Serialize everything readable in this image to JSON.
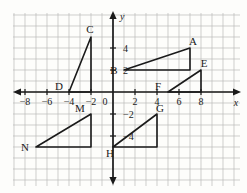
{
  "figure": {
    "type": "coordinate-plane",
    "background_color": "#fdfdfb",
    "grid_color": "#b9b9b9",
    "axis_color": "#1a1a1a",
    "shape_color": "#1a1a1a"
  },
  "axes": {
    "x_label": "x",
    "y_label": "y",
    "origin_label": "0",
    "x_ticks": [
      "-8",
      "-6",
      "-4",
      "-2",
      "2",
      "4",
      "6",
      "8"
    ],
    "y_ticks": [
      "4",
      "2",
      "-2",
      "-4"
    ],
    "x_range": [
      -9.5,
      9
    ],
    "y_range": [
      -7,
      6.5
    ],
    "grid": true,
    "grid_step": 1
  },
  "chart_data": {
    "type": "scatter",
    "title": "",
    "xlabel": "x",
    "ylabel": "y",
    "xlim": [
      -9.5,
      9
    ],
    "ylim": [
      -7,
      6.5
    ],
    "grid": true,
    "shapes": [
      {
        "name": "triangle-CD",
        "vertices": [
          {
            "label": "C",
            "x": -2,
            "y": 5,
            "label_dx": -1,
            "label_dy": -4
          },
          {
            "label": "D",
            "x": -4,
            "y": 0,
            "label_dx": -10,
            "label_dy": -2
          },
          {
            "label": "",
            "x": -2,
            "y": 0,
            "label_dx": 0,
            "label_dy": 0
          }
        ]
      },
      {
        "name": "triangle-AB",
        "vertices": [
          {
            "label": "A",
            "x": 7,
            "y": 4,
            "label_dx": 3,
            "label_dy": -3
          },
          {
            "label": "B",
            "x": 1,
            "y": 2,
            "label_dx": -10,
            "label_dy": 4
          },
          {
            "label": "",
            "x": 7,
            "y": 2,
            "label_dx": 0,
            "label_dy": 0
          }
        ]
      },
      {
        "name": "triangle-EF",
        "vertices": [
          {
            "label": "E",
            "x": 8,
            "y": 2,
            "label_dx": 3,
            "label_dy": -3
          },
          {
            "label": "F",
            "x": 5,
            "y": 0,
            "label_dx": -10,
            "label_dy": -2
          },
          {
            "label": "",
            "x": 8,
            "y": 0,
            "label_dx": 0,
            "label_dy": 0
          }
        ]
      },
      {
        "name": "triangle-MN",
        "vertices": [
          {
            "label": "M",
            "x": -2,
            "y": -2,
            "label_dx": -11,
            "label_dy": -2
          },
          {
            "label": "N",
            "x": -7,
            "y": -5,
            "label_dx": -11,
            "label_dy": 4
          },
          {
            "label": "",
            "x": -2,
            "y": -5,
            "label_dx": 0,
            "label_dy": 0
          }
        ]
      },
      {
        "name": "triangle-GH",
        "vertices": [
          {
            "label": "G",
            "x": 4,
            "y": -2,
            "label_dx": 3,
            "label_dy": -2
          },
          {
            "label": "H",
            "x": 0,
            "y": -5,
            "label_dx": -3,
            "label_dy": 10
          },
          {
            "label": "",
            "x": 4,
            "y": -5,
            "label_dx": 0,
            "label_dy": 0
          }
        ]
      }
    ],
    "point_labels": [
      "A",
      "B",
      "C",
      "D",
      "E",
      "F",
      "G",
      "H",
      "M",
      "N"
    ]
  }
}
